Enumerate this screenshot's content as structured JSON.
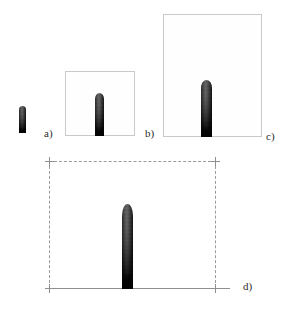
{
  "figure": {
    "type": "multi-panel-simulation-figure",
    "background_color": "#ffffff",
    "width": 288,
    "height": 313,
    "panel_count": 4
  },
  "panels": [
    {
      "id": "a",
      "label": "a)",
      "label_x": 44,
      "label_y": 128,
      "has_frame": false,
      "frame_style": "none",
      "frame": null,
      "object": {
        "name": "vertical-gradient-jet",
        "x": 19,
        "y": 106,
        "width": 7,
        "height": 27
      }
    },
    {
      "id": "b",
      "label": "b)",
      "label_x": 145,
      "label_y": 128,
      "has_frame": true,
      "frame_style": "solid",
      "frame": {
        "x": 65,
        "y": 71,
        "width": 70,
        "height": 65,
        "color": "#c9c9c9"
      },
      "object": {
        "name": "vertical-gradient-jet",
        "x": 95,
        "y": 93,
        "width": 9,
        "height": 43
      }
    },
    {
      "id": "c",
      "label": "c)",
      "label_x": 266,
      "label_y": 131,
      "has_frame": true,
      "frame_style": "solid",
      "frame": {
        "x": 163,
        "y": 14,
        "width": 99,
        "height": 123,
        "color": "#c9c9c9"
      },
      "object": {
        "name": "vertical-gradient-jet",
        "x": 201,
        "y": 80,
        "width": 11,
        "height": 57
      }
    },
    {
      "id": "d",
      "label": "d)",
      "label_x": 243,
      "label_y": 287,
      "has_frame": true,
      "frame_style": "dashed-open-bottom",
      "frame": {
        "x": 49,
        "y": 161,
        "width": 166,
        "height": 127,
        "color": "#9a9a9a"
      },
      "baseline": {
        "x": 49,
        "y": 288,
        "width": 181,
        "color": "#8f8f8f"
      },
      "object": {
        "name": "vertical-gradient-jet",
        "x": 122,
        "y": 204,
        "width": 11,
        "height": 85
      }
    }
  ],
  "colors": {
    "page_background": "#ffffff",
    "frame_solid": "#c9c9c9",
    "frame_dashed": "#9a9a9a",
    "baseline": "#8f8f8f",
    "label_text": "#2b2b2b",
    "object_tip": "#8d8d8d",
    "object_base": "#0a0a0a"
  }
}
